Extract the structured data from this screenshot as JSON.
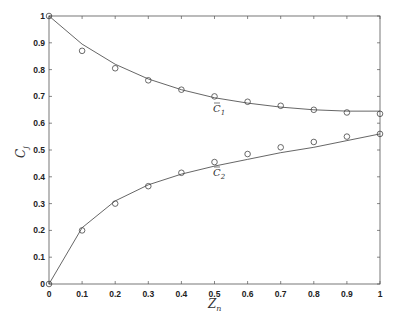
{
  "chart_data": {
    "type": "line",
    "title": "",
    "xlabel": "Z_n",
    "ylabel": "C_j",
    "xlim": [
      0,
      1
    ],
    "ylim": [
      0,
      1
    ],
    "x_ticks": [
      "0",
      "0.1",
      "0.2",
      "0.3",
      "0.4",
      "0.5",
      "0.6",
      "0.7",
      "0.8",
      "0.9",
      "1"
    ],
    "y_ticks": [
      "0",
      "0.1",
      "0.2",
      "0.3",
      "0.4",
      "0.5",
      "0.6",
      "0.7",
      "0.8",
      "0.9",
      "1"
    ],
    "grid": false,
    "x": [
      0,
      0.1,
      0.2,
      0.3,
      0.4,
      0.5,
      0.6,
      0.7,
      0.8,
      0.9,
      1.0
    ],
    "series": [
      {
        "name": "C1 (model)",
        "style": "line",
        "values": [
          1.0,
          0.895,
          0.82,
          0.765,
          0.725,
          0.695,
          0.675,
          0.66,
          0.65,
          0.645,
          0.645
        ]
      },
      {
        "name": "C1 (data)",
        "style": "markers",
        "values": [
          1.0,
          0.87,
          0.805,
          0.76,
          0.725,
          0.7,
          0.68,
          0.665,
          0.65,
          0.64,
          0.635
        ]
      },
      {
        "name": "C2 (model)",
        "style": "line",
        "values": [
          0.0,
          0.21,
          0.31,
          0.37,
          0.41,
          0.44,
          0.465,
          0.49,
          0.51,
          0.535,
          0.56
        ]
      },
      {
        "name": "C2 (data)",
        "style": "markers",
        "values": [
          0.0,
          0.2,
          0.3,
          0.365,
          0.415,
          0.455,
          0.485,
          0.51,
          0.53,
          0.55,
          0.56
        ]
      }
    ],
    "annotations": [
      {
        "text": "C̄1",
        "x": 0.5,
        "y": 0.665
      },
      {
        "text": "C̄2",
        "x": 0.5,
        "y": 0.42
      }
    ]
  },
  "labels": {
    "x_axis": "Z",
    "x_axis_sub": "n",
    "y_axis": "C",
    "y_axis_sub": "j",
    "c1": "C",
    "c1_sub": "1",
    "c2": "C",
    "c2_sub": "2"
  }
}
